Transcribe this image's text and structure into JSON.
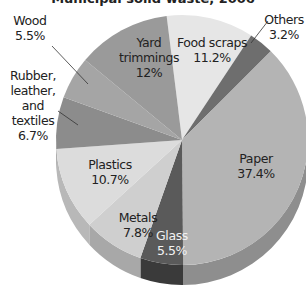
{
  "chart_data": {
    "type": "pie",
    "title": "Municipal solid waste, 2006",
    "style": "3d",
    "categories": [
      "Food scraps",
      "Others",
      "Paper",
      "Glass",
      "Metals",
      "Plastics",
      "Rubber, leather, and textiles",
      "Wood",
      "Yard trimmings"
    ],
    "values": [
      11.2,
      3.2,
      37.4,
      5.5,
      7.8,
      10.7,
      6.7,
      5.5,
      12.0
    ],
    "value_labels": [
      "11.2%",
      "3.2%",
      "37.4%",
      "5.5%",
      "7.8%",
      "10.7%",
      "6.7%",
      "5.5%",
      "12%"
    ],
    "colors": [
      "#e6e6e6",
      "#6e6e6e",
      "#b4b4b4",
      "#5a5a5a",
      "#cfcfcf",
      "#dcdcdc",
      "#8c8c8c",
      "#a5a5a5",
      "#9a9a9a"
    ],
    "side_colors": [
      "#c8c8c8",
      "#4e4e4e",
      "#8e8e8e",
      "#3a3a3a",
      "#a8a8a8",
      "#b8b8b8",
      "#6c6c6c",
      "#868686",
      "#7a7a7a"
    ],
    "start_angle_deg": -7,
    "direction": "clockwise"
  },
  "labels": {
    "title": "Municipal solid waste, 2006",
    "food": {
      "name": "Food scraps",
      "value": "11.2%"
    },
    "others": {
      "name": "Others",
      "value": "3.2%"
    },
    "paper": {
      "name": "Paper",
      "value": "37.4%"
    },
    "glass": {
      "name": "Glass",
      "value": "5.5%"
    },
    "metals": {
      "name": "Metals",
      "value": "7.8%"
    },
    "plastics": {
      "name": "Plastics",
      "value": "10.7%"
    },
    "rubber": {
      "line1": "Rubber,",
      "line2": "leather, and",
      "line3": "textiles",
      "value": "6.7%"
    },
    "wood": {
      "name": "Wood",
      "value": "5.5%"
    },
    "yard": {
      "line1": "Yard",
      "line2": "trimmings",
      "value": "12%"
    }
  }
}
